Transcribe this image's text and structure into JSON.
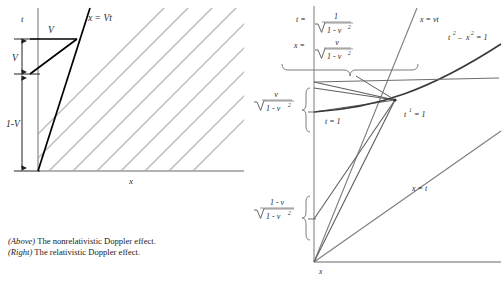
{
  "figure": {
    "caption_lines": [
      {
        "tag": "(Above)",
        "text": " The nonrelativistic Doppler effect."
      },
      {
        "tag": "(Right)",
        "text": " The relativistic Doppler effect."
      }
    ]
  },
  "left_diagram": {
    "name": "nonrelativistic Doppler spacetime diagram",
    "axis_t": "t",
    "axis_x": "x",
    "worldline_label": "x = Vt",
    "segment_label_horizontal": "V",
    "bracket_label_upper": "V",
    "bracket_label_lower": "1-V",
    "wavefront_color": "#b9b9b9",
    "axis_color": "#9a9a9a",
    "worldline_color": "#000000",
    "wavefront_count": 9
  },
  "right_diagram": {
    "name": "relativistic Doppler spacetime diagram",
    "axis_x": "x",
    "label_t_formula": {
      "lhs": "t =",
      "num": "1",
      "den_radicand": "1 - v",
      "den_exp": "2"
    },
    "label_x_formula": {
      "lhs": "x =",
      "num": "v",
      "den_radicand": "1 - v",
      "den_exp": "2"
    },
    "label_worldline": "x = vt",
    "label_hyperbola": {
      "t": "t",
      "t_exp": "2",
      "minus": "–",
      "x": "x",
      "x_exp": "2",
      "eq": "= 1"
    },
    "label_light_cone": "x = t",
    "label_t_one": "t = 1",
    "label_tprime_one": {
      "sym": "t",
      "prime": "1",
      "eq": "= 1"
    },
    "axis_frac_upper": {
      "num": "v",
      "den_radicand": "1 - v",
      "den_exp": "2"
    },
    "axis_frac_lower": {
      "num": "1 - v",
      "den_radicand": "1 - v",
      "den_exp": "2"
    },
    "axis_color": "#9a9a9a",
    "line_color": "#6e6e6e",
    "hyperbola_color": "#3a3a3a"
  }
}
